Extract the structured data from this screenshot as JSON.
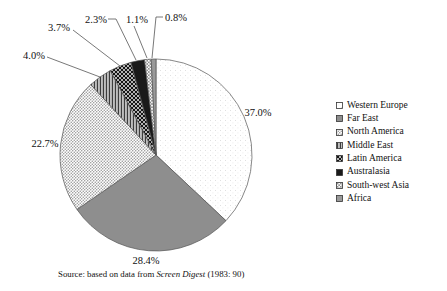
{
  "chart_data": {
    "type": "pie",
    "title": "",
    "categories": [
      "Western Europe",
      "Far East",
      "North America",
      "Middle East",
      "Latin America",
      "Australasia",
      "South-west Asia",
      "Africa"
    ],
    "values": [
      37.0,
      28.4,
      22.7,
      4.0,
      3.7,
      2.3,
      1.1,
      0.8
    ],
    "labels": [
      "37.0%",
      "28.4%",
      "22.7%",
      "4.0%",
      "3.7%",
      "2.3%",
      "1.1%",
      "0.8%"
    ],
    "patterns": [
      "speckle",
      "solid-gray",
      "dots",
      "vlines",
      "crosshatch",
      "solid-black",
      "fine-grid",
      "solid-gray-2"
    ],
    "start_angle_deg": 0,
    "direction": "clockwise",
    "legend_position": "right",
    "source_note": {
      "prefix": "Source: based on data from ",
      "italic": "Screen Digest",
      "suffix": " (1983: 90)"
    }
  },
  "colors": {
    "solid_gray": "#8e8e8e",
    "solid_black": "#1a1a1a",
    "solid_gray_2": "#9a9a9a",
    "outline": "#555555",
    "text": "#111111"
  }
}
